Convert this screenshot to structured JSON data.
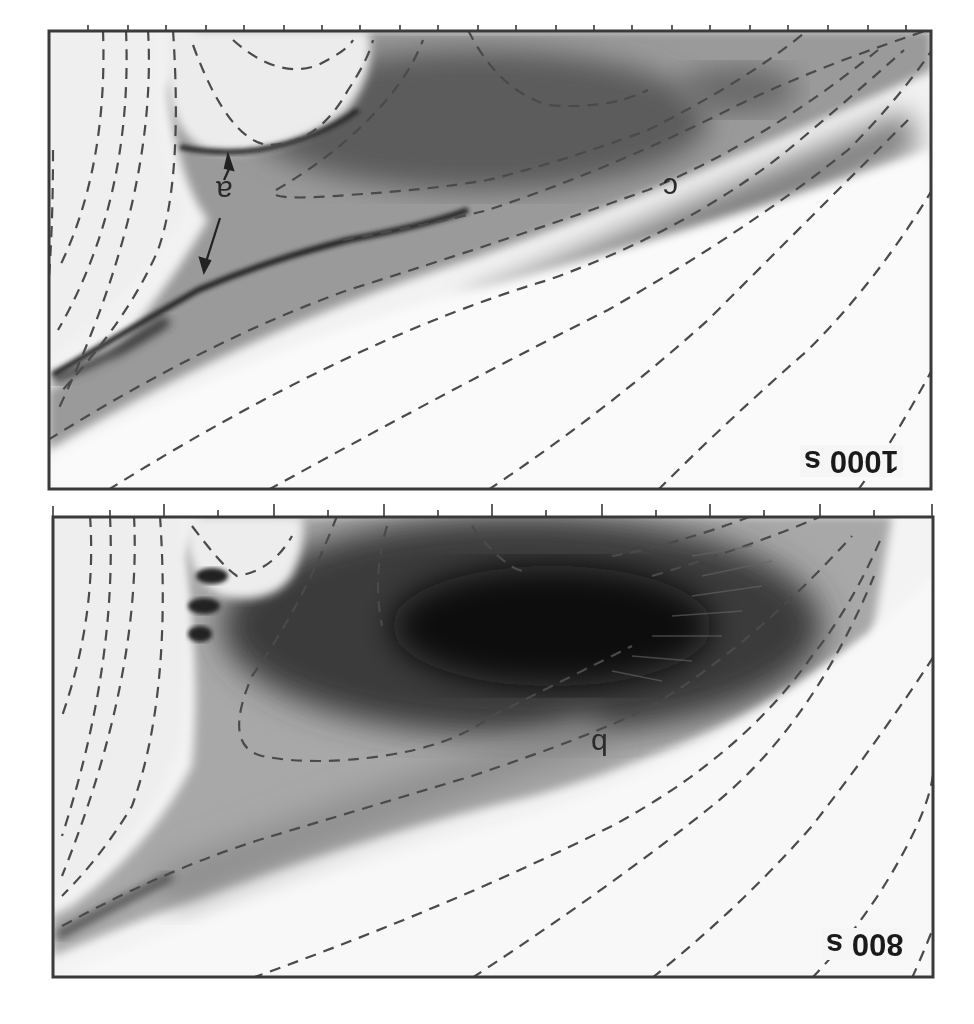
{
  "figure": {
    "orientation": "rotated 180 degrees",
    "style": {
      "frame_color": "#3a3a3a",
      "contour_color": "#4a4a4a",
      "background": "#ffffff"
    },
    "panels": [
      {
        "id": "top",
        "time_label": "1000 s",
        "region_labels": [
          {
            "id": "a",
            "text": "a",
            "annotation": "double-headed arrow spanning layer"
          },
          {
            "id": "c",
            "text": "c"
          }
        ]
      },
      {
        "id": "bottom",
        "time_label": "800 s",
        "region_labels": [
          {
            "id": "b",
            "text": "b"
          }
        ]
      }
    ],
    "caption": {
      "visible": "cropped, illegible"
    }
  }
}
